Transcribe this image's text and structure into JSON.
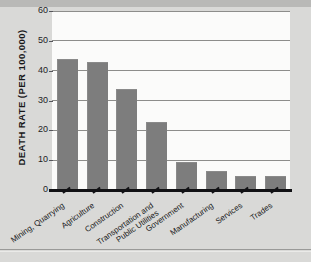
{
  "chart_data": {
    "type": "bar",
    "title": "",
    "xlabel": "",
    "ylabel": "DEATH RATE (PER 100,000)",
    "ylim": [
      0,
      60
    ],
    "yticks": [
      0,
      10,
      20,
      30,
      40,
      50,
      60
    ],
    "grid": true,
    "legend": null,
    "categories": [
      "Mining, Quarrying",
      "Agriculture",
      "Construction",
      "Transportation and Public Utilities",
      "Government",
      "Manufacturing",
      "Services",
      "Trades"
    ],
    "category_lines": [
      [
        "Mining, Quarrying"
      ],
      [
        "Agriculture"
      ],
      [
        "Construction"
      ],
      [
        "Transportation and",
        "Public Utilities"
      ],
      [
        "Government"
      ],
      [
        "Manufacturing"
      ],
      [
        "Services"
      ],
      [
        "Trades"
      ]
    ],
    "values": [
      43.5,
      42.5,
      33.5,
      22.3,
      9.1,
      6.1,
      4.3,
      4.4
    ],
    "bar_color": "#7d7d7d",
    "plot_background": "#fbfbfa",
    "page_background": "#d9d9d7",
    "axis_color": "#111114",
    "gridline_color": "#8d8d8b"
  }
}
